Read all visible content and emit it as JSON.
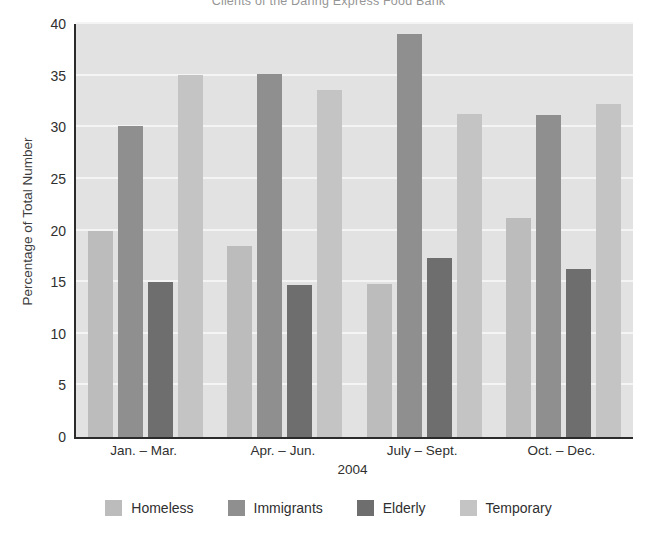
{
  "chart_data": {
    "type": "bar",
    "title": "Clients of the Daring Express Food Bank",
    "xlabel": "2004",
    "ylabel": "Percentage of Total Number",
    "categories": [
      "Jan. – Mar.",
      "Apr. – Jun.",
      "July – Sept.",
      "Oct. – Dec."
    ],
    "series": [
      {
        "name": "Homeless",
        "color": "#bcbcbc",
        "values": [
          20.0,
          18.5,
          14.8,
          21.2
        ]
      },
      {
        "name": "Immigrants",
        "color": "#8f8f8f",
        "values": [
          30.1,
          35.2,
          39.0,
          31.2
        ]
      },
      {
        "name": "Elderly",
        "color": "#6e6e6e",
        "values": [
          15.0,
          14.7,
          17.3,
          16.3
        ]
      },
      {
        "name": "Temporary",
        "color": "#c4c4c4",
        "values": [
          35.1,
          33.6,
          31.3,
          32.3
        ]
      }
    ],
    "ylim": [
      0,
      40
    ],
    "yticks": [
      0,
      5,
      10,
      15,
      20,
      25,
      30,
      35,
      40
    ],
    "ytick_labels": [
      "0",
      "5",
      "10",
      "15",
      "20",
      "25",
      "30",
      "35",
      "40"
    ],
    "grid": true,
    "legend_position": "bottom",
    "plot_background": "#e2e2e2",
    "gridline_color": "#f4f4f4",
    "axis_color": "#2b2b2b"
  }
}
